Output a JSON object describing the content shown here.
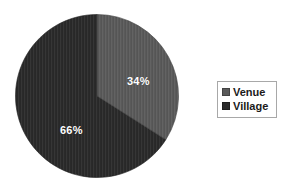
{
  "chart_data": {
    "type": "pie",
    "title": "",
    "categories": [
      "Venue",
      "Village"
    ],
    "values": [
      34,
      66
    ],
    "value_unit": "%",
    "data_labels": [
      "34%",
      "66%"
    ],
    "colors": [
      "#5a5a5a",
      "#2a2a2a"
    ],
    "start_angle_deg": 0,
    "direction": "clockwise",
    "legend": {
      "position": "right",
      "border_color": "#a8a8a8",
      "background": "#ffffff",
      "entries": [
        {
          "label": "Venue",
          "color": "#5a5a5a"
        },
        {
          "label": "Village",
          "color": "#2a2a2a"
        }
      ]
    },
    "background": "#ffffff",
    "label_color": "#ffffff"
  },
  "slices": [
    {
      "name": "Venue",
      "label": "34%",
      "percent": 34,
      "color": "#5a5a5a"
    },
    {
      "name": "Village",
      "label": "66%",
      "percent": 66,
      "color": "#2a2a2a"
    }
  ]
}
